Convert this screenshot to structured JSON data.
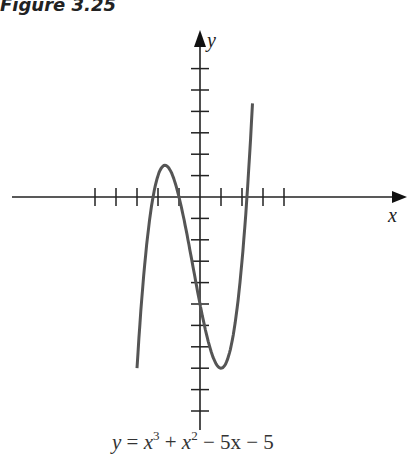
{
  "figure": {
    "title": "Figure 3.25"
  },
  "equation": {
    "lhs": "y",
    "eq": "=",
    "t1": "x",
    "t1_exp": "3",
    "op1": "+",
    "t2": "x",
    "t2_exp": "2",
    "op2": "−",
    "t3": "5x",
    "op3": "−",
    "t4": "5"
  },
  "chart_data": {
    "type": "line",
    "title": "Figure 3.25",
    "xlabel": "x",
    "ylabel": "y",
    "function": "y = x^3 + x^2 - 5x - 5",
    "xlim": [
      -5,
      5
    ],
    "ylim": [
      -11,
      8
    ],
    "x_ticks": [
      -5,
      -4,
      -3,
      -2,
      -1,
      1,
      2,
      3,
      4
    ],
    "y_ticks": [
      -10,
      -9,
      -8,
      -7,
      -6,
      -5,
      -4,
      -3,
      -2,
      -1,
      1,
      2,
      3,
      4,
      5,
      6
    ],
    "grid": false,
    "x": [
      -3,
      -2.5,
      -2,
      -1.5,
      -1,
      -0.5,
      0,
      0.5,
      1,
      1.5,
      2,
      2.5
    ],
    "values": [
      -8,
      -1.875,
      1,
      1.375,
      0,
      -2.375,
      -5,
      -7.125,
      -8,
      -6.875,
      -3,
      4.375
    ]
  }
}
